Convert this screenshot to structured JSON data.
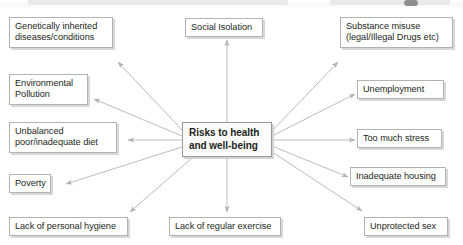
{
  "diagram": {
    "type": "spider-map",
    "center": {
      "id": "center",
      "label": "Risks to health\nand well-being",
      "bold": true
    },
    "nodes": [
      {
        "id": "genetically-inherited-diseases",
        "label": "Genetically inherited\ndiseases/conditions",
        "position": "top-left"
      },
      {
        "id": "environmental-pollution",
        "label": "Environmental\nPollution",
        "position": "left-upper"
      },
      {
        "id": "unbalanced-diet",
        "label": "Unbalanced\npoor/inadequate diet",
        "position": "left-middle"
      },
      {
        "id": "poverty",
        "label": "Poverty",
        "position": "left-lower"
      },
      {
        "id": "lack-of-personal-hygiene",
        "label": "Lack of personal hygiene",
        "position": "bottom-left"
      },
      {
        "id": "social-isolation",
        "label": "Social Isolation",
        "position": "top-center"
      },
      {
        "id": "lack-of-regular-exercise",
        "label": "Lack of regular exercise",
        "position": "bottom-center"
      },
      {
        "id": "substance-misuse",
        "label": "Substance misuse\n(legal/Illegal Drugs etc)",
        "position": "top-right"
      },
      {
        "id": "unemployment",
        "label": "Unemployment",
        "position": "right-upper"
      },
      {
        "id": "too-much-stress",
        "label": "Too much stress",
        "position": "right-middle"
      },
      {
        "id": "inadequate-housing",
        "label": "Inadequate housing",
        "position": "right-lower"
      },
      {
        "id": "unprotected-sex",
        "label": "Unprotected sex",
        "position": "bottom-right"
      }
    ],
    "colors": {
      "background": "#ffffff",
      "box_border": "#b3b3b3",
      "box_shadow": "#d8d8d8",
      "connector": "#b8b8b8",
      "text": "#231f20"
    }
  }
}
